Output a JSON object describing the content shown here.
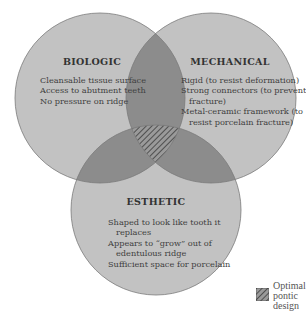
{
  "diagram": {
    "type": "venn",
    "sets": [
      {
        "id": "biologic",
        "title": "BIOLOGIC",
        "items": [
          "Cleansable tissue surface",
          "Access to abutment teeth",
          "No pressure on ridge"
        ]
      },
      {
        "id": "mechanical",
        "title": "MECHANICAL",
        "items": [
          "Rigid (to resist deformation)",
          "Strong connectors (to prevent",
          "fracture)",
          "Metal-ceramic framework (to",
          "resist porcelain fracture)"
        ]
      },
      {
        "id": "esthetic",
        "title": "ESTHETIC",
        "items": [
          "Shaped to look like tooth it",
          "replaces",
          "Appears to “grow” out of",
          "edentulous ridge",
          "Sufficient space for porcelain"
        ]
      }
    ],
    "legend": {
      "lines": [
        "Optimal",
        "pontic",
        "design"
      ]
    },
    "colors": {
      "circle_fill": "#c2c2c2",
      "overlap_fill": "#8c8c8c",
      "outline": "#7a7a7a",
      "hatch": "#3c3c3c"
    }
  }
}
